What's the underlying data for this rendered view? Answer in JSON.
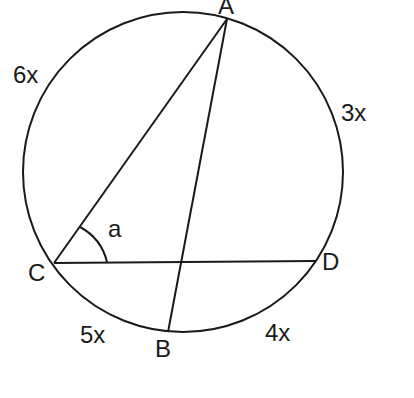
{
  "diagram": {
    "type": "circle-geometry",
    "stroke_color": "#1a1a1a",
    "background": "#ffffff",
    "circle": {
      "cx": 183,
      "cy": 172,
      "r": 160
    },
    "points": {
      "A": {
        "label": "A",
        "x": 227,
        "y": 19
      },
      "B": {
        "label": "B",
        "x": 168,
        "y": 332
      },
      "C": {
        "label": "C",
        "x": 54,
        "y": 263
      },
      "D": {
        "label": "D",
        "x": 315,
        "y": 261
      }
    },
    "chords": [
      {
        "from": "A",
        "to": "C"
      },
      {
        "from": "A",
        "to": "B"
      },
      {
        "from": "C",
        "to": "D"
      }
    ],
    "angle": {
      "label": "a",
      "vertex": "C",
      "between": [
        "A",
        "D"
      ]
    },
    "arcs": {
      "AC": {
        "label": "6x"
      },
      "AD": {
        "label": "3x"
      },
      "CB": {
        "label": "5x"
      },
      "BD": {
        "label": "4x"
      }
    }
  }
}
